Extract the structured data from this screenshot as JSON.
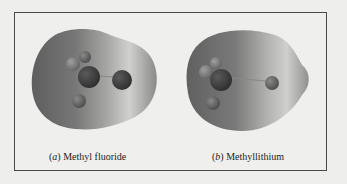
{
  "figure": {
    "panels": [
      {
        "label_letter": "a",
        "label_open": "(",
        "label_close": ")",
        "caption": "Methyl fluoride",
        "molecule": "CH3F",
        "surface": "electrostatic-potential-map"
      },
      {
        "label_letter": "b",
        "label_open": "(",
        "label_close": ")",
        "caption": "Methyllithium",
        "molecule": "CH3Li",
        "surface": "electrostatic-potential-map"
      }
    ],
    "colors": {
      "page_background": "#eeeeec",
      "frame_border": "#4a4a4a",
      "surface_dark": "#6a6a6a",
      "surface_light": "#c8c8c6",
      "atom_dark": "#3a3a3a",
      "atom_mid": "#6c6c6c"
    }
  }
}
